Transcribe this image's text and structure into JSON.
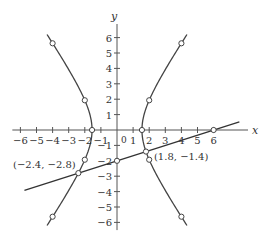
{
  "chart_data": {
    "type": "line",
    "title": "",
    "xlabel": "x",
    "ylabel": "y",
    "xlim": [
      -6.5,
      7.5
    ],
    "ylim": [
      -6.5,
      6.8
    ],
    "grid": false,
    "x_ticks": [
      -6,
      -5,
      -4,
      -3,
      -2,
      -1,
      1,
      2,
      3,
      4,
      5,
      6
    ],
    "x_tick_labels": [
      "−6",
      "−5",
      "−4",
      "−3",
      "−2",
      "−1",
      "1",
      "2",
      "3",
      "4",
      "5",
      "6"
    ],
    "y_ticks": [
      6,
      5,
      4,
      3,
      2,
      1,
      -1,
      -2,
      -3,
      -4,
      -5,
      -6
    ],
    "y_tick_labels": [
      "6",
      "5",
      "4",
      "3",
      "2",
      "1",
      "−1",
      "−2",
      "−3",
      "−4",
      "−5",
      "−6"
    ],
    "origin_label": "0",
    "series": [
      {
        "name": "hyperbola",
        "kind": "hyperbola",
        "equation": "x^2/2.4 - y^2/5.6 = 1",
        "a2": 2.4,
        "b2": 5.6,
        "y_range": [
          -6.2,
          6.2
        ],
        "markers": [
          [
            1.55,
            0
          ],
          [
            -1.55,
            0
          ],
          [
            2,
            1.93
          ],
          [
            -2,
            1.93
          ],
          [
            4,
            5.63
          ],
          [
            -4,
            5.63
          ],
          [
            2,
            -1.93
          ],
          [
            -2,
            -1.93
          ],
          [
            4,
            -5.63
          ],
          [
            -4,
            -5.63
          ]
        ]
      },
      {
        "name": "line",
        "kind": "line",
        "equation": "y = x/3 - 2",
        "x_range": [
          -5.75,
          7.6
        ],
        "markers": [
          [
            0,
            -2
          ],
          [
            6,
            0
          ]
        ]
      }
    ],
    "intersections": [
      {
        "x": -2.4,
        "y": -2.8,
        "label": "(−2.4, −2.8)"
      },
      {
        "x": 1.8,
        "y": -1.4,
        "label": "(1.8, −1.4)"
      }
    ]
  }
}
